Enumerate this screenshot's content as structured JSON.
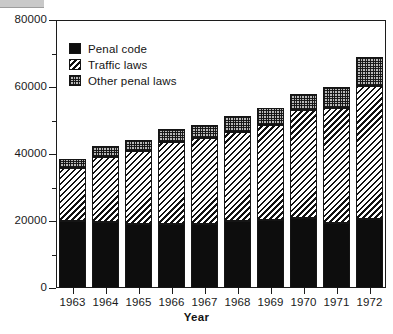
{
  "chart_data": {
    "type": "bar",
    "subtype": "stacked-bar",
    "title": "",
    "xlabel": "Year",
    "ylabel": "",
    "categories": [
      "1963",
      "1964",
      "1965",
      "1966",
      "1967",
      "1968",
      "1969",
      "1970",
      "1971",
      "1972"
    ],
    "series": [
      {
        "name": "Penal code",
        "fill": "solid-black",
        "color": "#0d0d0d",
        "values": [
          20100,
          19600,
          19000,
          19000,
          19100,
          20000,
          20300,
          21000,
          19400,
          20700
        ]
      },
      {
        "name": "Traffic laws",
        "fill": "diagonal-hatch",
        "color": "#111111",
        "values": [
          15700,
          19400,
          22000,
          24700,
          25700,
          26700,
          28400,
          32100,
          34400,
          39500
        ]
      },
      {
        "name": "Other penal laws",
        "fill": "checkered-gray",
        "color": "#b9b9b9",
        "values": [
          2800,
          3400,
          3200,
          3800,
          4000,
          4600,
          5000,
          4900,
          6300,
          8700
        ]
      }
    ],
    "totals": [
      38600,
      42400,
      44200,
      47500,
      48800,
      51300,
      53700,
      58000,
      60100,
      68900
    ],
    "stack_tops": {
      "penal_code": [
        20100,
        19600,
        19000,
        19000,
        19100,
        20000,
        20300,
        21000,
        19400,
        20700
      ],
      "traffic_cum": [
        35800,
        39000,
        41000,
        43700,
        44800,
        46700,
        48700,
        53100,
        53800,
        60200
      ],
      "total_cum": [
        38600,
        42400,
        44200,
        47500,
        48800,
        51300,
        53700,
        58000,
        60100,
        68900
      ]
    },
    "ylim": [
      0,
      80000
    ],
    "y_major_ticks": [
      0,
      20000,
      40000,
      60000,
      80000
    ],
    "y_major_tick_labels": [
      "0",
      "20000",
      "40000",
      "60000",
      "80000"
    ],
    "y_minor_ticks": [
      10000,
      30000,
      50000,
      70000
    ],
    "grid": false,
    "legend": {
      "position": "upper-left-inside",
      "entries": [
        {
          "label": "Penal code",
          "swatch": "solid-black-swatch"
        },
        {
          "label": "Traffic laws",
          "swatch": "diagonal-hatch-swatch"
        },
        {
          "label": "Other penal laws",
          "swatch": "checkered-gray-swatch"
        }
      ]
    }
  }
}
